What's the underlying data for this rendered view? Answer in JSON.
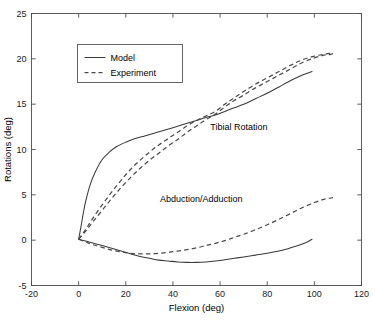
{
  "chart_data": {
    "type": "line",
    "title": "",
    "xlabel": "Flexion (deg)",
    "ylabel": "Rotations (deg)",
    "xlim": [
      -20,
      120
    ],
    "ylim": [
      -5,
      25
    ],
    "xticks": [
      -20,
      0,
      20,
      40,
      60,
      80,
      100,
      120
    ],
    "yticks": [
      -5,
      0,
      5,
      10,
      15,
      20,
      25
    ],
    "xtick_labels": [
      "-20",
      "0",
      "20",
      "40",
      "60",
      "80",
      "100",
      "120"
    ],
    "ytick_labels": [
      "-5",
      "0",
      "5",
      "10",
      "15",
      "20",
      "25"
    ],
    "grid": false,
    "legend_position": "upper-left",
    "legend_entries": [
      {
        "label": "Model",
        "style": "solid"
      },
      {
        "label": "Experiment",
        "style": "dashed"
      }
    ],
    "annotations": [
      {
        "text": "Tibial Rotation",
        "x": 68,
        "y": 12.1
      },
      {
        "text": "Abduction/Adduction",
        "x": 52,
        "y": 4.2
      }
    ],
    "series": [
      {
        "name": "Tibial Rotation - Model",
        "group": "Tibial Rotation",
        "style": "solid",
        "x": [
          0,
          1,
          2,
          3,
          5,
          7,
          10,
          13,
          16,
          20,
          24,
          28,
          32,
          36,
          40,
          45,
          50,
          55,
          58,
          62,
          66,
          70,
          75,
          80,
          85,
          90,
          94,
          97,
          99
        ],
        "y": [
          0.1,
          1.5,
          3.0,
          4.3,
          6.2,
          7.5,
          8.9,
          9.7,
          10.3,
          10.8,
          11.2,
          11.5,
          11.8,
          12.1,
          12.4,
          12.8,
          13.2,
          13.6,
          13.8,
          14.2,
          14.6,
          15.0,
          15.6,
          16.2,
          16.9,
          17.6,
          18.1,
          18.4,
          18.6
        ]
      },
      {
        "name": "Tibial Rotation - Experiment A",
        "group": "Tibial Rotation",
        "style": "dashed",
        "x": [
          0,
          3,
          6,
          10,
          14,
          18,
          22,
          26,
          30,
          34,
          38,
          42,
          46,
          50,
          54,
          58,
          62,
          66,
          70,
          75,
          80,
          85,
          90,
          95,
          100,
          104,
          107,
          108
        ],
        "y": [
          0.1,
          1.0,
          2.0,
          3.3,
          4.6,
          5.8,
          6.9,
          7.9,
          8.8,
          9.6,
          10.4,
          11.1,
          11.9,
          12.6,
          13.3,
          13.9,
          14.7,
          15.4,
          16.0,
          16.8,
          17.5,
          18.2,
          18.9,
          19.6,
          20.1,
          20.4,
          20.5,
          20.6
        ]
      },
      {
        "name": "Tibial Rotation - Experiment B",
        "group": "Tibial Rotation",
        "style": "dashed",
        "x": [
          0,
          3,
          6,
          10,
          14,
          18,
          22,
          26,
          30,
          34,
          38,
          42,
          46,
          50,
          54,
          58,
          62,
          66,
          70,
          75,
          80,
          85,
          90,
          95,
          100,
          104,
          107,
          108
        ],
        "y": [
          0.1,
          1.2,
          2.4,
          3.9,
          5.3,
          6.6,
          7.8,
          8.8,
          9.7,
          10.5,
          11.2,
          11.9,
          12.6,
          13.2,
          13.7,
          14.2,
          15.0,
          15.7,
          16.4,
          17.2,
          17.9,
          18.6,
          19.3,
          19.9,
          20.3,
          20.5,
          20.6,
          20.6
        ]
      },
      {
        "name": "Abduction/Adduction - Model",
        "group": "Abduction/Adduction",
        "style": "solid",
        "x": [
          0,
          3,
          6,
          10,
          14,
          18,
          22,
          26,
          30,
          34,
          38,
          42,
          46,
          50,
          54,
          58,
          62,
          66,
          70,
          75,
          80,
          85,
          88,
          91,
          94,
          97,
          99
        ],
        "y": [
          0.1,
          -0.1,
          -0.3,
          -0.6,
          -0.9,
          -1.2,
          -1.5,
          -1.8,
          -2.0,
          -2.2,
          -2.3,
          -2.4,
          -2.45,
          -2.45,
          -2.4,
          -2.3,
          -2.15,
          -2.0,
          -1.85,
          -1.65,
          -1.45,
          -1.2,
          -1.0,
          -0.75,
          -0.5,
          -0.2,
          0.1
        ]
      },
      {
        "name": "Abduction/Adduction - Experiment",
        "group": "Abduction/Adduction",
        "style": "dashed",
        "x": [
          0,
          3,
          6,
          10,
          14,
          18,
          22,
          26,
          30,
          34,
          38,
          42,
          46,
          50,
          54,
          58,
          62,
          66,
          70,
          75,
          80,
          85,
          90,
          95,
          100,
          104,
          107,
          109
        ],
        "y": [
          0.1,
          -0.2,
          -0.5,
          -0.8,
          -1.1,
          -1.3,
          -1.45,
          -1.5,
          -1.5,
          -1.45,
          -1.35,
          -1.2,
          -1.05,
          -0.85,
          -0.6,
          -0.35,
          -0.05,
          0.3,
          0.65,
          1.15,
          1.7,
          2.3,
          2.95,
          3.6,
          4.15,
          4.5,
          4.65,
          4.75
        ]
      }
    ]
  },
  "figure": {
    "background_color": "#ffffff",
    "axis_color": "#4d4d4d",
    "solid_series_color": "#3a3a3a",
    "dashed_series_color": "#4a4a4a"
  }
}
